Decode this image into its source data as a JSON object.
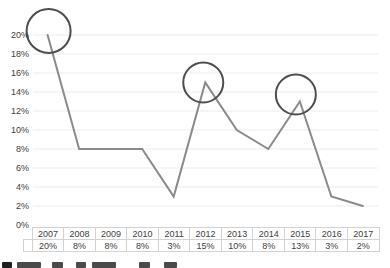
{
  "chart_data": {
    "type": "line",
    "title": "",
    "categories": [
      "2007",
      "2008",
      "2009",
      "2010",
      "2011",
      "2012",
      "2013",
      "2014",
      "2015",
      "2016",
      "2017"
    ],
    "values": [
      20,
      8,
      8,
      8,
      3,
      15,
      10,
      8,
      13,
      3,
      2
    ],
    "value_labels": [
      "20%",
      "8%",
      "8%",
      "8%",
      "3%",
      "15%",
      "10%",
      "8%",
      "13%",
      "3%",
      "2%"
    ],
    "ylim": [
      0,
      20
    ],
    "yticks": [
      {
        "value": 0,
        "label": "0%"
      },
      {
        "value": 2,
        "label": "2%"
      },
      {
        "value": 4,
        "label": "4%"
      },
      {
        "value": 6,
        "label": "6%"
      },
      {
        "value": 8,
        "label": "8%"
      },
      {
        "value": 10,
        "label": "10%"
      },
      {
        "value": 12,
        "label": "12%"
      },
      {
        "value": 14,
        "label": "14%"
      },
      {
        "value": 16,
        "label": "16%"
      },
      {
        "value": 18,
        "label": "18%"
      },
      {
        "value": 20,
        "label": "20%"
      }
    ],
    "grid": true,
    "legend_position": "none",
    "data_table_shown": true,
    "annotations": {
      "circled_years": [
        "2007",
        "2012",
        "2015"
      ]
    },
    "colors": {
      "line": "#8a8a8a",
      "circle": "#4d4d4d",
      "gridline": "#ebebeb",
      "table_border": "#d2d2d2",
      "text": "#404040"
    }
  }
}
